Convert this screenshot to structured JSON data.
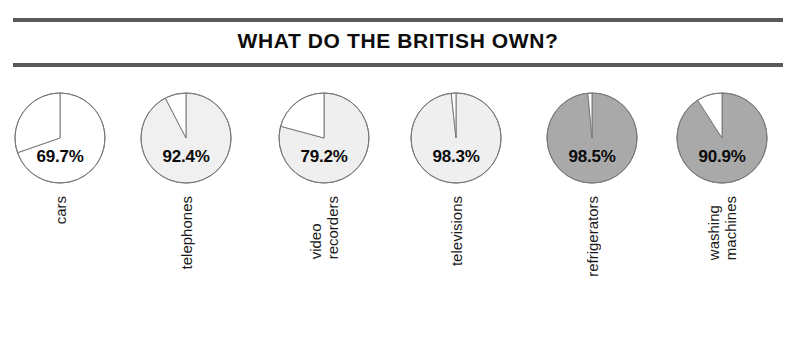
{
  "chart_data": {
    "type": "pie",
    "title": "WHAT DO THE BRITISH OWN?",
    "xlabel": "",
    "ylabel": "",
    "unit": "%",
    "legend": "none",
    "grid": false,
    "categories": [
      "cars",
      "telephones",
      "video recorders",
      "televisions",
      "refrigerators",
      "washing machines"
    ],
    "values": [
      69.7,
      92.4,
      79.2,
      98.3,
      98.5,
      90.9
    ],
    "value_labels": [
      "69.7%",
      "92.4%",
      "79.2%",
      "98.3%",
      "98.5%",
      "90.9%"
    ],
    "remainders": [
      30.3,
      7.6,
      20.8,
      1.7,
      1.5,
      9.1
    ],
    "series": [
      {
        "name": "owned",
        "values": [
          69.7,
          92.4,
          79.2,
          98.3,
          98.5,
          90.9
        ]
      },
      {
        "name": "not owned",
        "values": [
          30.3,
          7.6,
          20.8,
          1.7,
          1.5,
          9.1
        ]
      }
    ],
    "pies": [
      {
        "category": "cars",
        "label_lines": [
          "cars"
        ],
        "value": 69.7,
        "value_label": "69.7%",
        "remainder": 30.3,
        "fill": "#ffffff",
        "remainder_fill": "#ffffff"
      },
      {
        "category": "telephones",
        "label_lines": [
          "telephones"
        ],
        "value": 92.4,
        "value_label": "92.4%",
        "remainder": 7.6,
        "fill": "#f0f0f0",
        "remainder_fill": "#ffffff"
      },
      {
        "category": "video recorders",
        "label_lines": [
          "video",
          "recorders"
        ],
        "value": 79.2,
        "value_label": "79.2%",
        "remainder": 20.8,
        "fill": "#efefef",
        "remainder_fill": "#ffffff"
      },
      {
        "category": "televisions",
        "label_lines": [
          "televisions"
        ],
        "value": 98.3,
        "value_label": "98.3%",
        "remainder": 1.7,
        "fill": "#efefef",
        "remainder_fill": "#ffffff"
      },
      {
        "category": "refrigerators",
        "label_lines": [
          "refrigerators"
        ],
        "value": 98.5,
        "value_label": "98.5%",
        "remainder": 1.5,
        "fill": "#a9a9a9",
        "remainder_fill": "#ffffff"
      },
      {
        "category": "washing machines",
        "label_lines": [
          "washing",
          "machines"
        ],
        "value": 90.9,
        "value_label": "90.9%",
        "remainder": 9.1,
        "fill": "#a9a9a9",
        "remainder_fill": "#ffffff"
      }
    ],
    "colors": {
      "outline": "#7a7a7a",
      "light_fill": "#efefef",
      "dark_fill": "#a9a9a9",
      "white_fill": "#ffffff",
      "rule": "#5a5a5a",
      "text": "#0d0d0d"
    }
  },
  "labels": {
    "cars": "cars",
    "telephones": "telephones",
    "video_recorders_line1": "video",
    "video_recorders_line2": "recorders",
    "televisions": "televisions",
    "refrigerators": "refrigerators",
    "washing_line1": "washing",
    "washing_line2": "machines"
  }
}
